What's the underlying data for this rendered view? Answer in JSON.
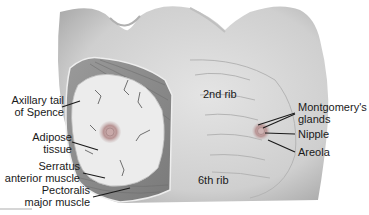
{
  "figure": {
    "colors": {
      "skin": "#d4d4d4",
      "skin_shadow": "#a8a8a8",
      "muscle": "#8a8a8a",
      "adipose": "#ececec",
      "vessel": "#6f6f6f",
      "areola": "#b58a8a",
      "label_text": "#1a1a1a",
      "leader_line": "#1a1a1a"
    }
  },
  "labels": {
    "axillary_tail": [
      "Axillary tail",
      "of Spence"
    ],
    "adipose": [
      "Adipose",
      "tissue"
    ],
    "serratus": [
      "Serratus",
      "anterior muscle"
    ],
    "pectoralis": [
      "Pectoralis",
      "major muscle"
    ],
    "rib2": "2nd rib",
    "rib6": "6th rib",
    "montgomery": [
      "Montgomery's",
      "glands"
    ],
    "nipple": "Nipple",
    "areola": "Areola"
  }
}
